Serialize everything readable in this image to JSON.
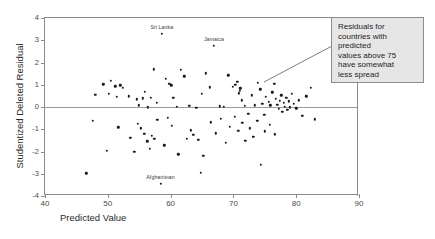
{
  "chart_data": {
    "type": "scatter",
    "title": "",
    "xlabel": "Predicted Value",
    "ylabel": "Studentized Deleted Residual",
    "xlim": [
      40,
      90
    ],
    "ylim": [
      -4,
      4
    ],
    "xticks": [
      40,
      50,
      60,
      70,
      80,
      90
    ],
    "yticks": [
      4,
      3,
      2,
      1,
      0,
      -1,
      -2,
      -3,
      -4
    ],
    "grid": false,
    "legend": null,
    "reference_lines": [
      {
        "axis": "y",
        "value": 0
      }
    ],
    "point_labels": [
      {
        "text": "Sri Lanka",
        "x": 58.6,
        "y": 3.3
      },
      {
        "text": "Jamaica",
        "x": 66.9,
        "y": 2.75
      },
      {
        "text": "Afghanistan",
        "x": 58.4,
        "y": -3.45
      }
    ],
    "annotations": [
      {
        "lines": [
          "Residuals for",
          "countries with",
          "predicted",
          "values above 75",
          "have somewhat",
          "less spread"
        ],
        "points_to": {
          "x": 75.5,
          "y": -0.1
        }
      }
    ],
    "points": [
      {
        "x": 48.0,
        "y": 0.56
      },
      {
        "x": 49.3,
        "y": 1.02
      },
      {
        "x": 50.2,
        "y": 0.58
      },
      {
        "x": 50.5,
        "y": 1.18
      },
      {
        "x": 51.2,
        "y": 0.93
      },
      {
        "x": 51.4,
        "y": 0.47
      },
      {
        "x": 52.0,
        "y": 0.97
      },
      {
        "x": 52.4,
        "y": 0.85
      },
      {
        "x": 53.3,
        "y": 0.48
      },
      {
        "x": 54.6,
        "y": 0.35
      },
      {
        "x": 54.9,
        "y": 0.08
      },
      {
        "x": 55.6,
        "y": 0.39
      },
      {
        "x": 55.9,
        "y": 0.68
      },
      {
        "x": 56.4,
        "y": -0.02
      },
      {
        "x": 56.8,
        "y": 0.41
      },
      {
        "x": 57.3,
        "y": 1.7
      },
      {
        "x": 57.8,
        "y": 0.2
      },
      {
        "x": 58.6,
        "y": 3.3
      },
      {
        "x": 59.2,
        "y": 1.26
      },
      {
        "x": 59.8,
        "y": 1.05
      },
      {
        "x": 60.1,
        "y": 0.98
      },
      {
        "x": 60.4,
        "y": 0.42
      },
      {
        "x": 61.0,
        "y": 0.02
      },
      {
        "x": 61.6,
        "y": 1.68
      },
      {
        "x": 62.2,
        "y": 1.38
      },
      {
        "x": 63.0,
        "y": 0.05
      },
      {
        "x": 64.1,
        "y": -0.03
      },
      {
        "x": 65.0,
        "y": 0.6
      },
      {
        "x": 65.6,
        "y": 1.52
      },
      {
        "x": 66.2,
        "y": 0.88
      },
      {
        "x": 66.9,
        "y": 2.75
      },
      {
        "x": 67.8,
        "y": 0.03
      },
      {
        "x": 68.5,
        "y": 0.02
      },
      {
        "x": 69.2,
        "y": 1.42
      },
      {
        "x": 69.9,
        "y": 0.92
      },
      {
        "x": 70.3,
        "y": 1.0
      },
      {
        "x": 70.6,
        "y": 1.12
      },
      {
        "x": 70.9,
        "y": 0.62
      },
      {
        "x": 71.0,
        "y": 0.72
      },
      {
        "x": 71.1,
        "y": 0.84
      },
      {
        "x": 71.3,
        "y": 0.3
      },
      {
        "x": 71.8,
        "y": 0.05
      },
      {
        "x": 72.4,
        "y": -0.3
      },
      {
        "x": 72.9,
        "y": 0.52
      },
      {
        "x": 73.4,
        "y": 0.08
      },
      {
        "x": 73.9,
        "y": 1.08
      },
      {
        "x": 74.3,
        "y": 0.8
      },
      {
        "x": 74.6,
        "y": 0.15
      },
      {
        "x": 74.9,
        "y": -0.35
      },
      {
        "x": 75.2,
        "y": 0.45
      },
      {
        "x": 75.6,
        "y": 0.22
      },
      {
        "x": 75.9,
        "y": 0.07
      },
      {
        "x": 76.2,
        "y": 0.66
      },
      {
        "x": 76.5,
        "y": 1.05
      },
      {
        "x": 76.8,
        "y": 0.36
      },
      {
        "x": 77.0,
        "y": 0.1
      },
      {
        "x": 77.2,
        "y": -0.08
      },
      {
        "x": 77.4,
        "y": 0.28
      },
      {
        "x": 77.6,
        "y": 0.52
      },
      {
        "x": 77.8,
        "y": -0.22
      },
      {
        "x": 78.0,
        "y": 0.18
      },
      {
        "x": 78.2,
        "y": 0.02
      },
      {
        "x": 78.4,
        "y": 0.4
      },
      {
        "x": 78.6,
        "y": -0.12
      },
      {
        "x": 78.8,
        "y": 0.25
      },
      {
        "x": 79.0,
        "y": -0.02
      },
      {
        "x": 79.3,
        "y": 0.6
      },
      {
        "x": 79.6,
        "y": 0.14
      },
      {
        "x": 80.0,
        "y": -0.06
      },
      {
        "x": 80.4,
        "y": 0.3
      },
      {
        "x": 81.0,
        "y": -0.4
      },
      {
        "x": 81.6,
        "y": 0.48
      },
      {
        "x": 82.3,
        "y": 0.86
      },
      {
        "x": 83.0,
        "y": -0.55
      },
      {
        "x": 47.6,
        "y": -0.62
      },
      {
        "x": 49.8,
        "y": -1.98
      },
      {
        "x": 51.7,
        "y": -0.92
      },
      {
        "x": 53.6,
        "y": -1.38
      },
      {
        "x": 54.2,
        "y": -2.02
      },
      {
        "x": 54.8,
        "y": -0.75
      },
      {
        "x": 55.3,
        "y": -0.95
      },
      {
        "x": 55.8,
        "y": -1.2
      },
      {
        "x": 56.3,
        "y": -1.55
      },
      {
        "x": 56.7,
        "y": -1.88
      },
      {
        "x": 57.0,
        "y": -1.3
      },
      {
        "x": 57.4,
        "y": -1.44
      },
      {
        "x": 57.9,
        "y": -0.58
      },
      {
        "x": 58.4,
        "y": -3.45
      },
      {
        "x": 59.0,
        "y": -1.72
      },
      {
        "x": 59.6,
        "y": -0.48
      },
      {
        "x": 60.2,
        "y": -0.84
      },
      {
        "x": 61.2,
        "y": -2.12
      },
      {
        "x": 62.6,
        "y": -1.42
      },
      {
        "x": 63.2,
        "y": -1.05
      },
      {
        "x": 63.6,
        "y": -1.26
      },
      {
        "x": 64.4,
        "y": -1.48
      },
      {
        "x": 65.2,
        "y": -2.2
      },
      {
        "x": 66.4,
        "y": -0.68
      },
      {
        "x": 67.2,
        "y": -1.18
      },
      {
        "x": 68.0,
        "y": -0.52
      },
      {
        "x": 68.8,
        "y": -1.6
      },
      {
        "x": 69.4,
        "y": -0.9
      },
      {
        "x": 70.2,
        "y": -0.44
      },
      {
        "x": 70.8,
        "y": -1.06
      },
      {
        "x": 71.4,
        "y": -0.72
      },
      {
        "x": 71.9,
        "y": -1.52
      },
      {
        "x": 72.6,
        "y": -0.95
      },
      {
        "x": 73.2,
        "y": -1.35
      },
      {
        "x": 73.8,
        "y": -0.62
      },
      {
        "x": 74.4,
        "y": -2.6
      },
      {
        "x": 75.0,
        "y": -1.1
      },
      {
        "x": 75.8,
        "y": -0.8
      },
      {
        "x": 76.6,
        "y": -1.22
      },
      {
        "x": 64.8,
        "y": -2.95
      },
      {
        "x": 46.6,
        "y": -2.98
      }
    ]
  }
}
